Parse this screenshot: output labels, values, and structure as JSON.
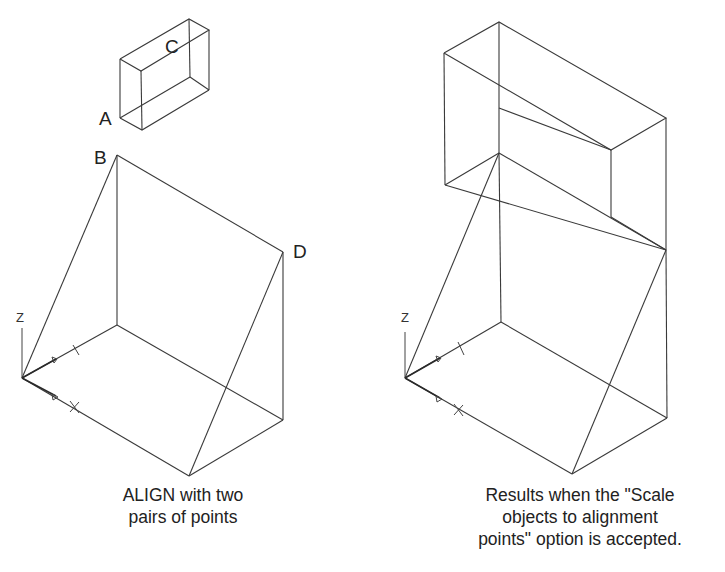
{
  "left_figure": {
    "point_labels": {
      "A": "A",
      "B": "B",
      "C": "C",
      "D": "D"
    },
    "axis_labels": {
      "z": "Z"
    },
    "caption_line1": "ALIGN with two",
    "caption_line2": "pairs of points"
  },
  "right_figure": {
    "axis_labels": {
      "z": "Z"
    },
    "caption_line1": "Results when the \"Scale",
    "caption_line2": "objects to alignment",
    "caption_line3": "points\" option is accepted."
  },
  "colors": {
    "line": "#3a3a3a",
    "text": "#222222",
    "background": "#ffffff"
  }
}
